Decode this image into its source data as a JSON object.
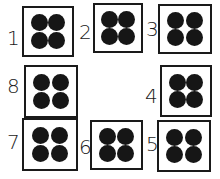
{
  "diagram": {
    "boxes": [
      {
        "label": "1",
        "dots": 4,
        "box": [
          22,
          6,
          52,
          51
        ],
        "label_pos": [
          7,
          28
        ]
      },
      {
        "label": "2",
        "dots": 4,
        "box": [
          93,
          3,
          50,
          50
        ],
        "label_pos": [
          79,
          22
        ]
      },
      {
        "label": "3",
        "dots": 4,
        "box": [
          158,
          4,
          54,
          50
        ],
        "label_pos": [
          146,
          19
        ]
      },
      {
        "label": "8",
        "dots": 4,
        "box": [
          24,
          65,
          54,
          53
        ],
        "label_pos": [
          7,
          76
        ]
      },
      {
        "label": "4",
        "dots": 4,
        "box": [
          160,
          65,
          52,
          52
        ],
        "label_pos": [
          145,
          86
        ]
      },
      {
        "label": "7",
        "dots": 4,
        "box": [
          22,
          118,
          56,
          53
        ],
        "label_pos": [
          7,
          132
        ]
      },
      {
        "label": "6",
        "dots": 4,
        "box": [
          90,
          120,
          53,
          50
        ],
        "label_pos": [
          79,
          137
        ]
      },
      {
        "label": "5",
        "dots": 4,
        "box": [
          157,
          120,
          54,
          52
        ],
        "label_pos": [
          146,
          134
        ]
      }
    ],
    "colors": {
      "stroke": "#1a1a1a",
      "dot": "#161616",
      "background": "#ffffff"
    }
  }
}
